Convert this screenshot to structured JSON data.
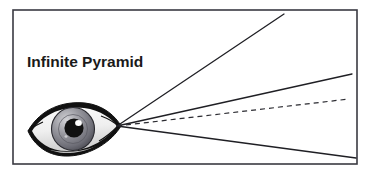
{
  "figure": {
    "title": "Infinite Pyramid",
    "caption_label": "Infinite Pyramid",
    "background_color": "#ffffff",
    "frame": {
      "name": "diagram-border",
      "stroke_color": "#3a3a42",
      "stroke_width": 1.6,
      "x": 13,
      "y": 10,
      "width": 344,
      "height": 154,
      "fill": "#ffffff"
    },
    "title_position": {
      "x": 27,
      "y": 67
    },
    "vertex": {
      "label": "eye-vertex",
      "x": 117,
      "y": 126
    },
    "eye": {
      "label": "eye-illustration",
      "outline_color": "#111111",
      "sclera_color": "#f2f2f2",
      "sclera_shadow_color": "#d7d7d7",
      "iris_color": "#7c7c84",
      "iris_light_color": "#d0d0d4",
      "iris_dark_color": "#4e4e56",
      "pupil_color": "#111111",
      "highlight_color": "#ffffff",
      "center_x": 72,
      "center_y": 130,
      "width": 88,
      "height": 42
    },
    "rays": [
      {
        "name": "ray-upper",
        "style": "solid",
        "stroke_color": "#1f1f24",
        "stroke_width": 1.3,
        "x1": 117,
        "y1": 126,
        "x2": 284,
        "y2": 14
      },
      {
        "name": "ray-middle",
        "style": "solid",
        "stroke_color": "#1f1f24",
        "stroke_width": 1.3,
        "x1": 117,
        "y1": 126,
        "x2": 352,
        "y2": 74
      },
      {
        "name": "ray-axis",
        "style": "dashed",
        "dash_pattern": "5 4",
        "stroke_color": "#2b2b31",
        "stroke_width": 1.2,
        "x1": 117,
        "y1": 126,
        "x2": 349,
        "y2": 99
      },
      {
        "name": "ray-lower",
        "style": "solid",
        "stroke_color": "#1f1f24",
        "stroke_width": 1.3,
        "x1": 117,
        "y1": 126,
        "x2": 356,
        "y2": 158
      }
    ]
  }
}
